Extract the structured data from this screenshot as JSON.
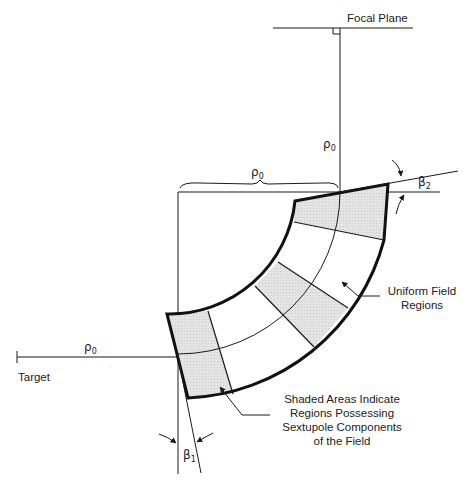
{
  "labels": {
    "focal_plane": "Focal Plane",
    "target": "Target",
    "rho": "ρ",
    "rho_sub": "0",
    "beta": "β",
    "beta1_sub": "1",
    "beta2_sub": "2",
    "uniform_line1": "Uniform Field",
    "uniform_line2": "Regions",
    "shaded_line1": "Shaded Areas Indicate",
    "shaded_line2": "Regions Possessing",
    "shaded_line3": "Sextupole Components",
    "shaded_line4": "of the Field"
  },
  "colors": {
    "line": "#1a1a1a",
    "shade": "#e2e2e2"
  }
}
